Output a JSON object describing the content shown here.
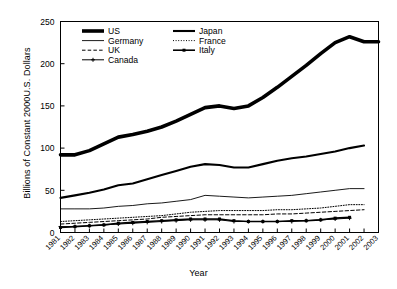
{
  "chart_data": {
    "type": "line",
    "title": "",
    "xlabel": "Year",
    "ylabel": "Billions of Constant 2000U.S. Dollars",
    "xlim": [
      1981,
      2003
    ],
    "ylim": [
      0,
      250
    ],
    "yticks": [
      0,
      50,
      100,
      150,
      200,
      250
    ],
    "ytick_labels": [
      "0",
      "50",
      "100",
      "150",
      "200",
      "250"
    ],
    "grid": false,
    "legend_position": "top-left-inside",
    "x": [
      1981,
      1982,
      1983,
      1984,
      1985,
      1986,
      1987,
      1988,
      1989,
      1990,
      1991,
      1992,
      1993,
      1994,
      1995,
      1996,
      1997,
      1998,
      1999,
      2000,
      2001,
      2002,
      2003
    ],
    "categories": [
      "1981",
      "1982",
      "1983",
      "1984",
      "1985",
      "1986",
      "1987",
      "1988",
      "1989",
      "1990",
      "1991",
      "1992",
      "1993",
      "1994",
      "1995",
      "1996",
      "1997",
      "1998",
      "1999",
      "2000",
      "2001",
      "2002",
      "2003"
    ],
    "series": [
      {
        "name": "US",
        "style": "thick-solid",
        "x": [
          1981,
          1982,
          1983,
          1984,
          1985,
          1986,
          1987,
          1988,
          1989,
          1990,
          1991,
          1992,
          1993,
          1994,
          1995,
          1996,
          1997,
          1998,
          1999,
          2000,
          2001,
          2002,
          2003
        ],
        "values": [
          92,
          92,
          97,
          105,
          113,
          116,
          120,
          125,
          132,
          140,
          148,
          150,
          147,
          150,
          160,
          172,
          185,
          198,
          212,
          225,
          232,
          226,
          226
        ]
      },
      {
        "name": "Japan",
        "style": "medium-solid",
        "x": [
          1981,
          1982,
          1983,
          1984,
          1985,
          1986,
          1987,
          1988,
          1989,
          1990,
          1991,
          1992,
          1993,
          1994,
          1995,
          1996,
          1997,
          1998,
          1999,
          2000,
          2001,
          2002
        ],
        "values": [
          41,
          44,
          47,
          51,
          56,
          58,
          63,
          68,
          73,
          78,
          81,
          80,
          77,
          77,
          81,
          85,
          88,
          90,
          93,
          96,
          100,
          103
        ]
      },
      {
        "name": "Germany",
        "style": "thin-solid",
        "x": [
          1981,
          1982,
          1983,
          1984,
          1985,
          1986,
          1987,
          1988,
          1989,
          1990,
          1991,
          1992,
          1993,
          1994,
          1995,
          1996,
          1997,
          1998,
          1999,
          2000,
          2001,
          2002
        ],
        "values": [
          28,
          28,
          28,
          29,
          31,
          32,
          34,
          35,
          37,
          39,
          44,
          43,
          42,
          41,
          42,
          43,
          44,
          46,
          48,
          50,
          52,
          52
        ]
      },
      {
        "name": "France",
        "style": "dotted",
        "x": [
          1981,
          1982,
          1983,
          1984,
          1985,
          1986,
          1987,
          1988,
          1989,
          1990,
          1991,
          1992,
          1993,
          1994,
          1995,
          1996,
          1997,
          1998,
          1999,
          2000,
          2001,
          2002
        ],
        "values": [
          13,
          14,
          15,
          16,
          17,
          18,
          19,
          20,
          22,
          24,
          25,
          26,
          26,
          26,
          26,
          27,
          27,
          28,
          29,
          31,
          33,
          33
        ]
      },
      {
        "name": "UK",
        "style": "dashed",
        "x": [
          1981,
          1982,
          1983,
          1984,
          1985,
          1986,
          1987,
          1988,
          1989,
          1990,
          1991,
          1992,
          1993,
          1994,
          1995,
          1996,
          1997,
          1998,
          1999,
          2000,
          2001,
          2002
        ],
        "values": [
          10,
          11,
          12,
          13,
          14,
          15,
          16,
          18,
          19,
          20,
          21,
          21,
          21,
          21,
          21,
          22,
          22,
          23,
          24,
          25,
          26,
          27
        ]
      },
      {
        "name": "Italy",
        "style": "marked-thick",
        "x": [
          1981,
          1982,
          1983,
          1984,
          1985,
          1986,
          1987,
          1988,
          1989,
          1990,
          1991,
          1992,
          1993,
          1994,
          1995,
          1996,
          1997,
          1998,
          1999,
          2000,
          2001
        ],
        "values": [
          6,
          7,
          8,
          9,
          11,
          12,
          13,
          14,
          15,
          16,
          16,
          16,
          14,
          13,
          13,
          13,
          14,
          14,
          15,
          17,
          18
        ]
      },
      {
        "name": "Canada",
        "style": "marked-thin",
        "x": [
          1981,
          1982,
          1983,
          1984,
          1985,
          1986,
          1987,
          1988,
          1989,
          1990,
          1991,
          1992,
          1993,
          1994,
          1995,
          1996,
          1997,
          1998,
          1999,
          2000,
          2001
        ],
        "values": [
          7,
          7,
          8,
          9,
          10,
          11,
          12,
          13,
          14,
          15,
          15,
          15,
          13,
          13,
          13,
          13,
          13,
          14,
          15,
          16,
          17
        ]
      }
    ],
    "legend_entries": [
      {
        "label": "US",
        "style": "thick-solid"
      },
      {
        "label": "Japan",
        "style": "medium-solid"
      },
      {
        "label": "Germany",
        "style": "thin-solid"
      },
      {
        "label": "France",
        "style": "dotted"
      },
      {
        "label": "UK",
        "style": "dashed"
      },
      {
        "label": "Italy",
        "style": "marked-thick"
      },
      {
        "label": "Canada",
        "style": "marked-thin"
      }
    ],
    "colors": {
      "line": "#000000",
      "axis": "#000000",
      "background": "#ffffff"
    }
  }
}
